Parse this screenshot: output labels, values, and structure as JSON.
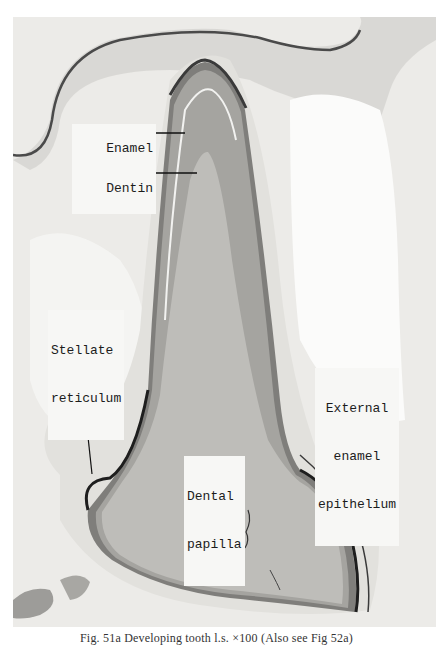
{
  "figure": {
    "labels": {
      "enamel": "Enamel",
      "dentin": "Dentin",
      "stellate_reticulum_line1": "Stellate",
      "stellate_reticulum_line2": "reticulum",
      "external_line1": "External",
      "external_line2": "enamel",
      "external_line3": "epithelium",
      "dental_papilla_line1": "Dental",
      "dental_papilla_line2": "papilla"
    },
    "caption": "Fig. 51a   Developing tooth  l.s. ×100 (Also see Fig 52a)"
  },
  "colors": {
    "background": "#ffffff",
    "tissue_light": "#ecebe8",
    "papilla": "#b9b8b4",
    "dentin": "#9f9e9b",
    "enamel": "#8a8986",
    "outline": "#2a2a2a",
    "label_bg": "#f7f7f5"
  }
}
